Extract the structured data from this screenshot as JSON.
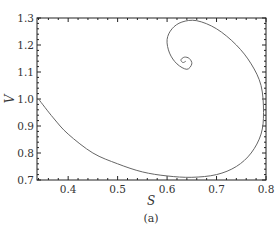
{
  "chart_data": {
    "type": "line",
    "title": "",
    "caption": "(a)",
    "xlabel": "S",
    "ylabel": "V",
    "xlim": [
      0.337,
      0.8
    ],
    "ylim": [
      0.7,
      1.3
    ],
    "xticks": [
      "0.4",
      "0.5",
      "0.6",
      "0.7",
      "0.8"
    ],
    "yticks": [
      "0.7",
      "0.8",
      "0.9",
      "1.0",
      "1.1",
      "1.2",
      "1.3"
    ],
    "grid": false,
    "legend": null,
    "series": [
      {
        "name": "trajectory",
        "color": "#555555",
        "x": [
          0.34,
          0.37,
          0.4,
          0.45,
          0.5,
          0.55,
          0.6,
          0.65,
          0.7,
          0.74,
          0.77,
          0.79,
          0.795,
          0.79,
          0.77,
          0.74,
          0.7,
          0.66,
          0.63,
          0.61,
          0.6,
          0.605,
          0.62,
          0.64,
          0.65,
          0.645,
          0.635,
          0.628,
          0.632,
          0.638
        ],
        "y": [
          1.0,
          0.93,
          0.87,
          0.8,
          0.76,
          0.73,
          0.715,
          0.71,
          0.72,
          0.75,
          0.8,
          0.87,
          0.95,
          1.05,
          1.13,
          1.2,
          1.26,
          1.29,
          1.285,
          1.26,
          1.22,
          1.17,
          1.13,
          1.11,
          1.13,
          1.15,
          1.155,
          1.145,
          1.135,
          1.14
        ]
      }
    ]
  }
}
